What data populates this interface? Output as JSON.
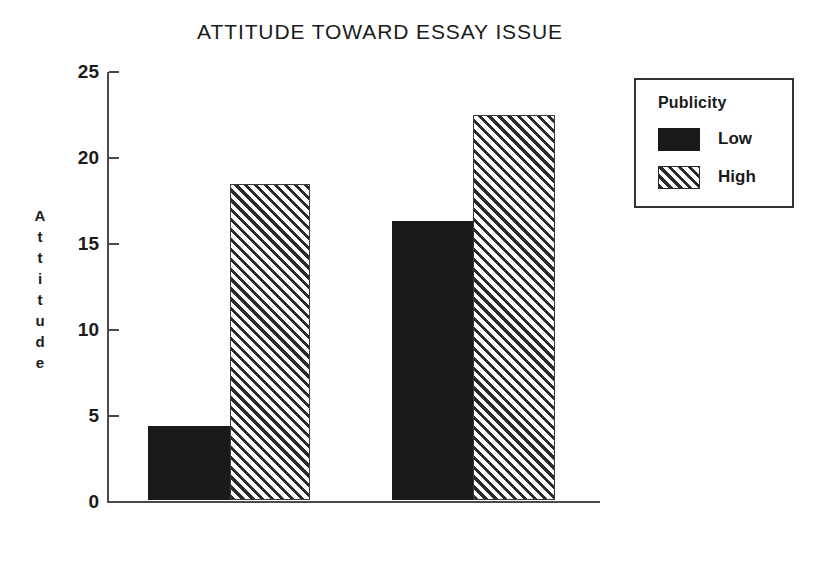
{
  "chart_data": {
    "type": "bar",
    "title": "ATTITUDE TOWARD ESSAY ISSUE",
    "xlabel": "",
    "ylabel": "Attitude",
    "ylim": [
      0,
      25
    ],
    "yticks": [
      0,
      5,
      10,
      15,
      20,
      25
    ],
    "ytick_labels": [
      "0",
      "5",
      "10",
      "15",
      "20",
      "25"
    ],
    "grid": false,
    "categories": [
      "Group 1",
      "Group 2"
    ],
    "legend": {
      "title": "Publicity",
      "position": "right",
      "entries": [
        {
          "label": "Low",
          "fill": "solid",
          "color": "#1a1a1a"
        },
        {
          "label": "High",
          "fill": "hatch",
          "color": "#2b2b2b"
        }
      ]
    },
    "series": [
      {
        "name": "Low",
        "fill": "solid",
        "values": [
          4.3,
          16.2
        ]
      },
      {
        "name": "High",
        "fill": "hatch",
        "values": [
          18.4,
          22.4
        ]
      }
    ],
    "bars": [
      {
        "group": 0,
        "series": "Low",
        "value": 4.3,
        "fill": "solid",
        "left": 41,
        "width": 82
      },
      {
        "group": 0,
        "series": "High",
        "value": 18.4,
        "fill": "hatch",
        "left": 123,
        "width": 80
      },
      {
        "group": 1,
        "series": "Low",
        "value": 16.2,
        "fill": "solid",
        "left": 285,
        "width": 81
      },
      {
        "group": 1,
        "series": "High",
        "value": 22.4,
        "fill": "hatch",
        "left": 366,
        "width": 82
      }
    ]
  },
  "y_axis_title_letters": [
    "A",
    "t",
    "t",
    "i",
    "t",
    "u",
    "d",
    "e"
  ]
}
